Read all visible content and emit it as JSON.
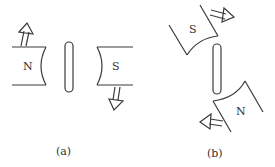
{
  "figure": {
    "panel_a": {
      "caption": "(a)",
      "left_magnet": {
        "pole": "N",
        "motion": "up"
      },
      "right_magnet": {
        "pole": "S",
        "motion": "down"
      },
      "bar": "soft-iron rod (vertical)"
    },
    "panel_b": {
      "caption": "(b)",
      "upper_magnet": {
        "pole": "S",
        "motion": "right"
      },
      "lower_magnet": {
        "pole": "N",
        "motion": "left"
      },
      "bar": "soft-iron rod (vertical)"
    }
  },
  "colors": {
    "line": "#3a3a3a",
    "background": "#ffffff"
  }
}
